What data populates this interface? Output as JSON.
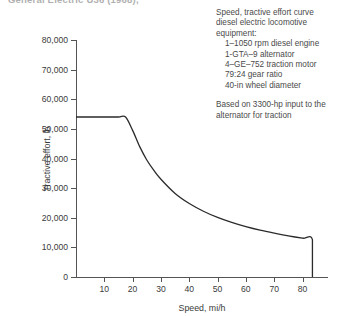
{
  "top_caption": "General Electric U36 (1968),",
  "annotation": {
    "header_lines": [
      "Speed, tractive effort curve",
      "diesel electric locomotive",
      "equipment:"
    ],
    "items": [
      "1–1050 rpm diesel engine",
      "1-GTA–9 alternator",
      "4–GE–752 traction motor",
      "79:24 gear ratio",
      "40-in wheel diameter"
    ],
    "based_on": [
      "Based on 3300-hp input to the",
      "alternator for traction"
    ]
  },
  "chart_data": {
    "type": "line",
    "title": "",
    "xlabel": "Speed, mi/h",
    "ylabel": "Tractive effort, lb",
    "xlim": [
      0,
      89
    ],
    "ylim": [
      0,
      80000
    ],
    "grid": false,
    "legend": false,
    "x_ticks": [
      10,
      20,
      30,
      40,
      50,
      60,
      70,
      80
    ],
    "x_tick_labels": [
      "10",
      "20",
      "30",
      "40",
      "50",
      "60",
      "70",
      "80"
    ],
    "y_ticks": [
      0,
      10000,
      20000,
      30000,
      40000,
      50000,
      60000,
      70000,
      80000
    ],
    "y_tick_labels": [
      "0",
      "10,000",
      "20,000",
      "30,000",
      "40,000",
      "50,000",
      "60,000",
      "70,000",
      "80,000"
    ],
    "series": [
      {
        "name": "Tractive effort",
        "color": "#2b2b2b",
        "x": [
          0,
          5,
          10,
          15,
          17.5,
          20,
          22.5,
          25,
          27.5,
          30,
          35,
          40,
          45,
          50,
          55,
          60,
          65,
          70,
          75,
          80,
          83.5,
          83.5
        ],
        "y": [
          54000,
          54000,
          54000,
          54000,
          54000,
          49500,
          44000,
          39500,
          36000,
          33000,
          28200,
          24800,
          22200,
          20100,
          18400,
          17000,
          15800,
          14800,
          13900,
          13100,
          12600,
          0
        ]
      }
    ],
    "annotations": {
      "plateau_value": 54000,
      "knee_speed": 17.5,
      "cutoff_speed": 83.5,
      "cutoff_value": 12600
    }
  }
}
